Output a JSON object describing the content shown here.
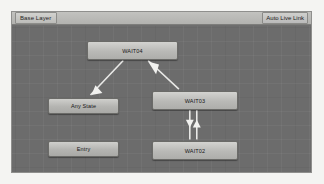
{
  "window": {
    "name": "animator-window",
    "breadcrumb": "Base Layer",
    "live_link_label": "Auto Live Link",
    "background_color": "#6c6c6c",
    "node_color": "#c4c4c1",
    "edge_color": "#e8e8e6"
  },
  "graph": {
    "nodes": [
      {
        "id": "wait04",
        "label": "WAIT04",
        "type": "state"
      },
      {
        "id": "wait03",
        "label": "WAIT03",
        "type": "state"
      },
      {
        "id": "anystate",
        "label": "Any State",
        "type": "special"
      },
      {
        "id": "entry",
        "label": "Entry",
        "type": "special"
      },
      {
        "id": "wait02",
        "label": "WAIT02",
        "type": "state"
      }
    ],
    "transitions": [
      {
        "from": "wait04",
        "to": "anystate",
        "style": "diagonal"
      },
      {
        "from": "wait03",
        "to": "wait04",
        "style": "diagonal"
      },
      {
        "from": "wait03",
        "to": "wait02",
        "style": "vertical-down"
      },
      {
        "from": "wait02",
        "to": "wait03",
        "style": "vertical-up"
      }
    ]
  }
}
